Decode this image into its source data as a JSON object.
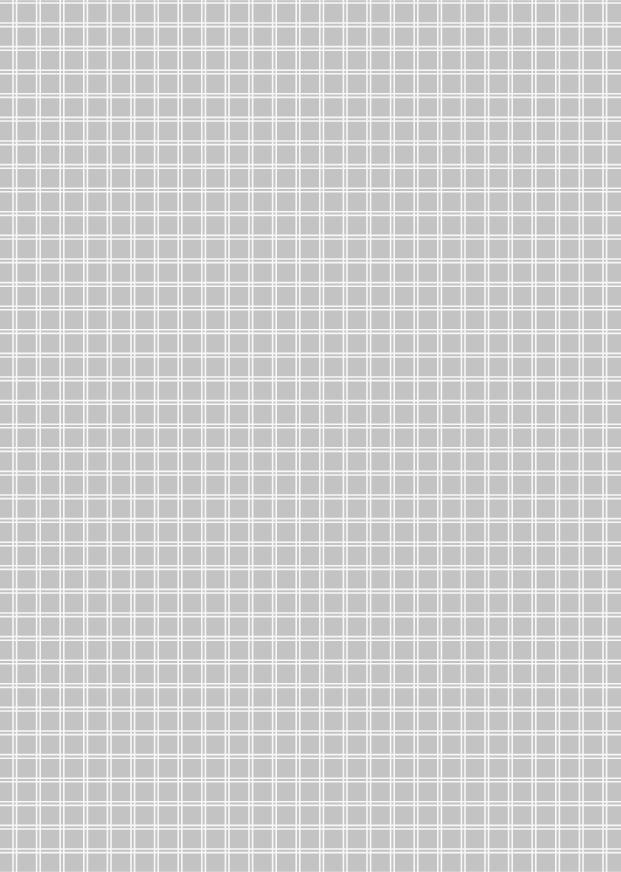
{
  "sheet": {
    "type": "grid-paper",
    "background_color": "#c3c3c3",
    "line_color": "#f7f7f7",
    "pitch_x": 23.6,
    "pitch_y": 23.6,
    "offset_x": 13,
    "offset_y": 23,
    "double_line_gap": 2,
    "line_width": 1.6
  }
}
